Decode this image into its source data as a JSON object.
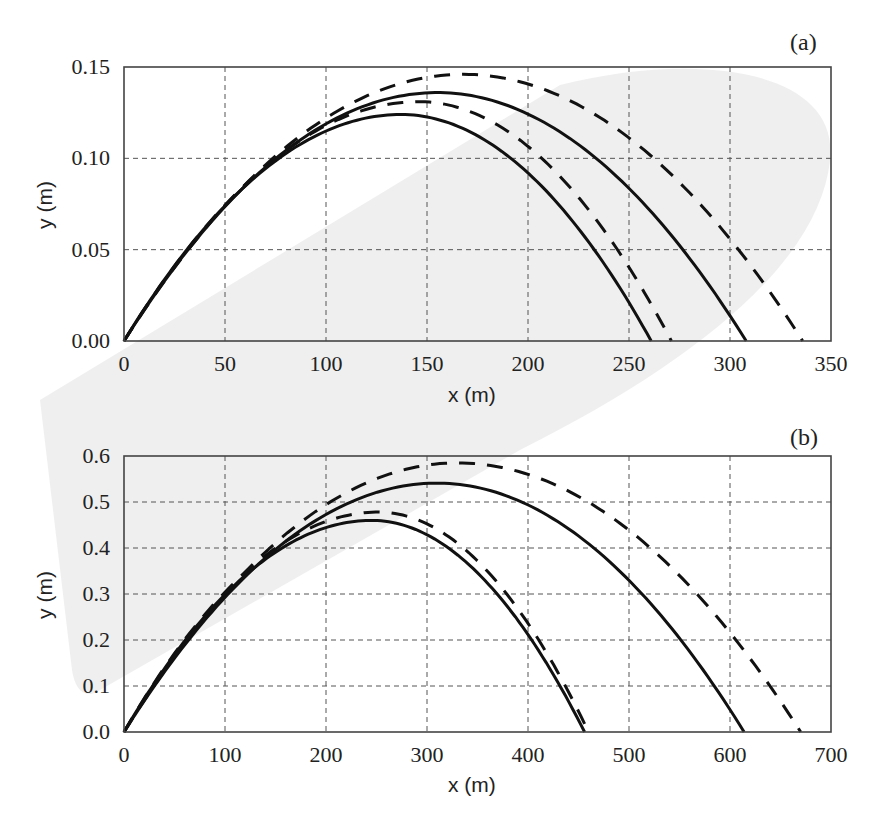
{
  "chart_data": [
    {
      "panel": "(a)",
      "type": "line",
      "title": "",
      "xlabel": "x (m)",
      "ylabel": "y (m)",
      "xlim": [
        0,
        350
      ],
      "ylim": [
        0,
        0.15
      ],
      "xticks": [
        "0",
        "50",
        "100",
        "150",
        "200",
        "250",
        "300",
        "350"
      ],
      "yticks": [
        "0.00",
        "0.05",
        "0.10",
        "0.15"
      ],
      "grid": true,
      "legend": null,
      "series": [
        {
          "name": "solid-1",
          "style": "solid",
          "peak_x": 137,
          "peak_y": 0.124,
          "range": 261
        },
        {
          "name": "dashed-1",
          "style": "dashed",
          "peak_x": 146,
          "peak_y": 0.131,
          "range": 271
        },
        {
          "name": "solid-2",
          "style": "solid",
          "peak_x": 155,
          "peak_y": 0.136,
          "range": 308
        },
        {
          "name": "dashed-2",
          "style": "dashed",
          "peak_x": 168,
          "peak_y": 0.146,
          "range": 336
        }
      ]
    },
    {
      "panel": "(b)",
      "type": "line",
      "title": "",
      "xlabel": "x (m)",
      "ylabel": "y (m)",
      "xlim": [
        0,
        700
      ],
      "ylim": [
        0,
        0.6
      ],
      "xticks": [
        "0",
        "100",
        "200",
        "300",
        "400",
        "500",
        "600",
        "700"
      ],
      "yticks": [
        "0.0",
        "0.1",
        "0.2",
        "0.3",
        "0.4",
        "0.5",
        "0.6"
      ],
      "grid": true,
      "legend": null,
      "series": [
        {
          "name": "solid-1",
          "style": "solid",
          "peak_x": 245,
          "peak_y": 0.46,
          "range": 456
        },
        {
          "name": "dashed-1",
          "style": "dashed",
          "peak_x": 252,
          "peak_y": 0.478,
          "range": 460
        },
        {
          "name": "solid-2",
          "style": "solid",
          "peak_x": 310,
          "peak_y": 0.541,
          "range": 614
        },
        {
          "name": "dashed-2",
          "style": "dashed",
          "peak_x": 330,
          "peak_y": 0.585,
          "range": 670
        }
      ]
    }
  ],
  "panels": {
    "a": {
      "label": "(a)",
      "xlabel": "x (m)",
      "ylabel": "y (m)"
    },
    "b": {
      "label": "(b)",
      "xlabel": "x (m)",
      "ylabel": "y (m)"
    }
  },
  "colors": {
    "line": "#111111",
    "grid": "#555555",
    "watermark": "#ebebeb"
  }
}
